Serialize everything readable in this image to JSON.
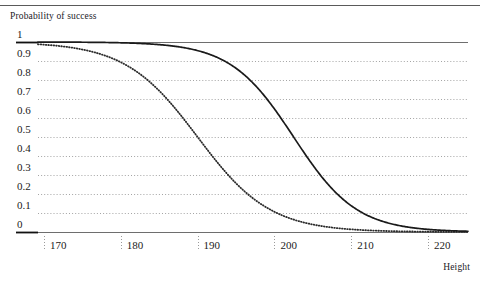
{
  "chart_data": {
    "type": "line",
    "title": "",
    "ylabel": "Probability of success",
    "xlabel": "Height",
    "xlim": [
      166.5,
      225.5
    ],
    "ylim": [
      0,
      1
    ],
    "grid": true,
    "legend_position": "none",
    "xticks": [
      "170",
      "180",
      "190",
      "200",
      "210",
      "220"
    ],
    "xtick_values": [
      170,
      180,
      190,
      200,
      210,
      220
    ],
    "yticks": [
      "1",
      "0.9",
      "0.8",
      "0.7",
      "0.6",
      "0.5",
      "0.4",
      "0.3",
      "0.2",
      "0.1",
      "0"
    ],
    "ytick_values": [
      1,
      0.9,
      0.8,
      0.7,
      0.6,
      0.5,
      0.4,
      0.3,
      0.2,
      0.1,
      0
    ],
    "series": [
      {
        "name": "dotted-curve",
        "style": "dotted",
        "color": "#2b2b2b",
        "midpoint": 190.0,
        "scale": 4.7,
        "x": [
          166.5,
          168,
          170,
          172,
          174,
          176,
          178,
          180,
          182,
          184,
          186,
          188,
          190,
          192,
          194,
          196,
          198,
          200,
          202,
          204,
          206,
          208,
          210,
          212,
          214,
          216,
          218,
          220,
          222,
          225.5
        ],
        "values": [
          0.993,
          0.991,
          0.986,
          0.979,
          0.969,
          0.954,
          0.932,
          0.901,
          0.857,
          0.798,
          0.722,
          0.628,
          0.523,
          0.416,
          0.316,
          0.231,
          0.163,
          0.112,
          0.075,
          0.05,
          0.033,
          0.021,
          0.014,
          0.009,
          0.006,
          0.004,
          0.003,
          0.002,
          0.001,
          0.0005
        ]
      },
      {
        "name": "solid-curve",
        "style": "solid",
        "color": "#1a1a1a",
        "midpoint": 202.5,
        "scale": 4.1,
        "x": [
          166.5,
          170,
          174,
          178,
          182,
          186,
          188,
          190,
          192,
          194,
          196,
          198,
          200,
          202,
          204,
          206,
          208,
          210,
          212,
          214,
          216,
          218,
          220,
          222,
          225.5
        ],
        "values": [
          0.9999,
          0.9997,
          0.9993,
          0.9981,
          0.995,
          0.987,
          0.979,
          0.966,
          0.945,
          0.911,
          0.86,
          0.787,
          0.691,
          0.576,
          0.453,
          0.336,
          0.236,
          0.159,
          0.103,
          0.066,
          0.041,
          0.025,
          0.016,
          0.009,
          0.004
        ]
      }
    ]
  },
  "axes": {
    "y_caption": "Probability of success",
    "x_caption": "Height"
  }
}
